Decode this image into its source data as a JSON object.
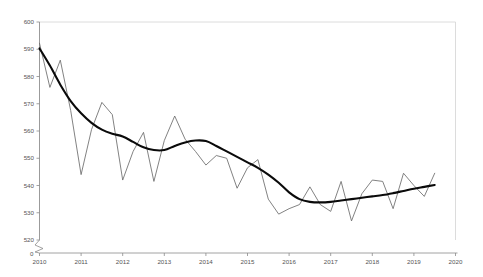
{
  "chart_data": {
    "type": "line",
    "title": "",
    "subtitle": "",
    "xlabel": "",
    "ylabel": "",
    "xlim": [
      2010,
      2020
    ],
    "ylim": [
      520,
      600
    ],
    "y_axis_break": true,
    "y_break_label": "0",
    "grid": false,
    "legend_position": "none",
    "x_tick_labels": [
      "2010",
      "2011",
      "2012",
      "2013",
      "2014",
      "2015",
      "2016",
      "2017",
      "2018",
      "2019",
      "2020"
    ],
    "x_tick_values": [
      2010,
      2011,
      2012,
      2013,
      2014,
      2015,
      2016,
      2017,
      2018,
      2019,
      2020
    ],
    "y_tick_labels": [
      "520",
      "530",
      "540",
      "550",
      "560",
      "570",
      "580",
      "590",
      "600"
    ],
    "y_tick_values": [
      520,
      530,
      540,
      550,
      560,
      570,
      580,
      590,
      600
    ],
    "x": [
      2010.0,
      2010.25,
      2010.5,
      2010.75,
      2011.0,
      2011.25,
      2011.5,
      2011.75,
      2012.0,
      2012.25,
      2012.5,
      2012.75,
      2013.0,
      2013.25,
      2013.5,
      2013.75,
      2014.0,
      2014.25,
      2014.5,
      2014.75,
      2015.0,
      2015.25,
      2015.5,
      2015.75,
      2016.0,
      2016.25,
      2016.5,
      2016.75,
      2017.0,
      2017.25,
      2017.5,
      2017.75,
      2018.0,
      2018.25,
      2018.5,
      2018.75,
      2019.0,
      2019.25,
      2019.5
    ],
    "series": [
      {
        "name": "Observed",
        "style": "thin-gray",
        "color": "#6b6b6b",
        "values": [
          592.2,
          576.0,
          586.0,
          567.5,
          544.0,
          560.5,
          570.5,
          566.0,
          542.0,
          552.5,
          559.5,
          541.5,
          556.5,
          565.5,
          557.0,
          552.5,
          547.5,
          551.0,
          550.0,
          539.0,
          546.5,
          549.5,
          535.0,
          529.5,
          531.5,
          533.0,
          539.5,
          533.0,
          530.5,
          541.5,
          527.0,
          537.0,
          542.0,
          541.5,
          531.5,
          544.5,
          540.0,
          536.0,
          544.5
        ]
      },
      {
        "name": "Trend",
        "style": "thick-black",
        "color": "#0a0a0a",
        "values": [
          590.3,
          584.0,
          577.0,
          571.0,
          566.5,
          563.0,
          560.5,
          559.0,
          558.0,
          556.0,
          554.0,
          553.0,
          553.0,
          554.5,
          555.8,
          556.5,
          556.3,
          554.5,
          552.5,
          550.5,
          548.5,
          546.5,
          544.0,
          541.0,
          537.5,
          535.0,
          534.0,
          533.8,
          534.0,
          534.5,
          535.0,
          535.5,
          536.0,
          536.5,
          537.2,
          538.0,
          538.8,
          539.5,
          540.2
        ]
      }
    ]
  },
  "axes": {
    "break_symbol_name": "axis-break-zigzag",
    "origin_label": "0"
  }
}
